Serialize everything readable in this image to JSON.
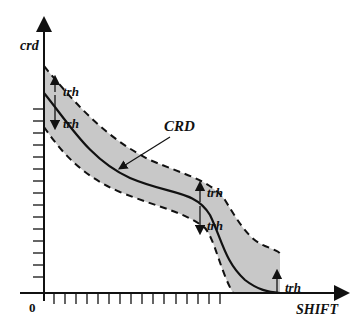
{
  "diagram": {
    "y_axis_label": "crd",
    "x_axis_label": "SHIFT",
    "origin_label": "0",
    "curve_label": "CRD",
    "threshold_labels": {
      "top_left_upper": "trh",
      "top_left_lower": "trh",
      "mid_upper": "trh",
      "mid_lower": "trh",
      "end": "trh"
    },
    "colors": {
      "band_fill": "#c8c8c8",
      "line": "#111111",
      "background": "#ffffff"
    },
    "y_tick_count": 15,
    "x_tick_count": 16
  }
}
